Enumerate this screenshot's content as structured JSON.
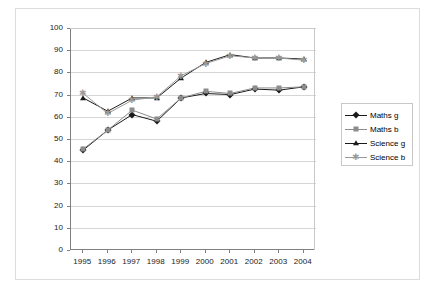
{
  "chart_data": {
    "type": "line",
    "title": "",
    "xlabel": "",
    "ylabel": "% level 4+",
    "categories": [
      "1995",
      "1996",
      "1997",
      "1998",
      "1999",
      "2000",
      "2001",
      "2002",
      "2003",
      "2004"
    ],
    "ylim": [
      0,
      100
    ],
    "ytick_values": [
      0,
      10,
      20,
      30,
      40,
      50,
      60,
      70,
      80,
      90,
      100
    ],
    "ytick_labels": [
      "0",
      "10",
      "20",
      "30",
      "40",
      "50",
      "60",
      "70",
      "80",
      "90",
      "100"
    ],
    "grid": true,
    "legend_position": "right",
    "series": [
      {
        "name": "Maths g",
        "marker": "diamond",
        "color": "#1a1a1a",
        "values": [
          45.0,
          54.0,
          61.0,
          58.0,
          68.5,
          70.5,
          70.0,
          72.5,
          72.0,
          73.5
        ]
      },
      {
        "name": "Maths b",
        "marker": "square",
        "color": "#8c8c8c",
        "values": [
          45.5,
          54.0,
          63.0,
          59.0,
          68.5,
          71.5,
          70.5,
          73.0,
          73.0,
          73.5
        ]
      },
      {
        "name": "Science g",
        "marker": "triangle",
        "color": "#1a1a1a",
        "values": [
          68.5,
          62.5,
          68.5,
          68.5,
          77.5,
          84.5,
          88.0,
          86.5,
          86.5,
          86.0
        ]
      },
      {
        "name": "Science b",
        "marker": "star",
        "color": "#9a9a9a",
        "values": [
          70.5,
          61.5,
          67.5,
          69.0,
          78.5,
          84.0,
          87.5,
          86.5,
          86.5,
          85.5
        ]
      }
    ]
  },
  "legend": {
    "items": [
      {
        "label": "Maths g"
      },
      {
        "label": "Maths b"
      },
      {
        "label": "Science g"
      },
      {
        "label": "Science b"
      }
    ]
  }
}
